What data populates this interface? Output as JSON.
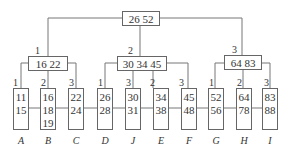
{
  "root": {
    "keys": "26  52"
  },
  "internal": [
    {
      "label": "1",
      "keys": "16  22"
    },
    {
      "label": "2",
      "keys": "30  34  45"
    },
    {
      "label": "3",
      "keys": "64  83"
    }
  ],
  "leaves": [
    {
      "label": "1",
      "keys": [
        "11",
        "15"
      ],
      "name": "A"
    },
    {
      "label": "2",
      "keys": [
        "16",
        "18",
        "19"
      ],
      "name": "B"
    },
    {
      "label": "3",
      "keys": [
        "22",
        "24"
      ],
      "name": "C"
    },
    {
      "label": "1",
      "keys": [
        "26",
        "28"
      ],
      "name": "D"
    },
    {
      "label": "3",
      "keys": [
        "30",
        "31"
      ],
      "name": "J"
    },
    {
      "label": "2",
      "keys": [
        "34",
        "38"
      ],
      "name": "E"
    },
    {
      "label": "3",
      "keys": [
        "45",
        "48"
      ],
      "name": "F"
    },
    {
      "label": "1",
      "keys": [
        "52",
        "56"
      ],
      "name": "G"
    },
    {
      "label": "2",
      "keys": [
        "64",
        "78"
      ],
      "name": "H"
    },
    {
      "label": "3",
      "keys": [
        "83",
        "88"
      ],
      "name": "I"
    }
  ]
}
